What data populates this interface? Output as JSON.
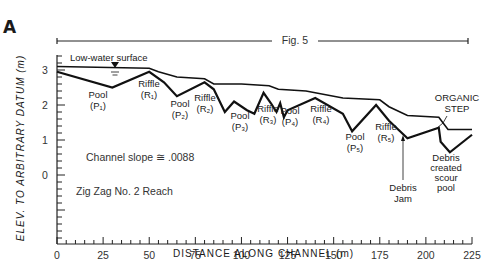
{
  "panel_label": "A",
  "figure_ref": "Fig. 5",
  "chart_data": {
    "type": "line",
    "title": "",
    "xlabel": "DISTANCE ALONG CHANNEL (m)",
    "ylabel": "ELEV. TO ARBITRARY DATUM (m)",
    "xlim": [
      0,
      225
    ],
    "ylim": [
      -1,
      3.5
    ],
    "x_ticks": [
      0,
      25,
      50,
      75,
      100,
      125,
      150,
      175,
      200,
      225
    ],
    "y_ticks": [
      0,
      1,
      2,
      3
    ],
    "grid": false,
    "series": [
      {
        "name": "Low-water surface",
        "x": [
          0,
          50,
          55,
          65,
          80,
          85,
          100,
          115,
          120,
          135,
          155,
          175,
          180,
          190,
          207,
          212,
          225
        ],
        "y": [
          3.1,
          3.05,
          2.95,
          2.8,
          2.75,
          2.6,
          2.6,
          2.55,
          2.45,
          2.4,
          2.2,
          2.15,
          1.95,
          1.7,
          1.65,
          1.3,
          1.3
        ]
      },
      {
        "name": "Channel bed",
        "x": [
          0,
          30,
          50,
          58,
          65,
          80,
          85,
          91,
          96,
          103,
          107,
          112,
          116,
          119,
          121,
          123,
          125,
          140,
          155,
          160,
          173,
          180,
          190,
          207,
          208,
          213,
          225
        ],
        "y": [
          2.95,
          2.5,
          2.95,
          2.65,
          2.25,
          2.65,
          2.45,
          1.8,
          2.1,
          1.85,
          1.75,
          2.35,
          2.05,
          1.8,
          2.05,
          1.65,
          1.85,
          2.2,
          1.75,
          1.25,
          2.0,
          1.55,
          1.05,
          1.35,
          0.95,
          0.65,
          1.15
        ]
      }
    ],
    "annotations": [
      {
        "text": "Low-water surface",
        "x": 10,
        "y": 3.25
      },
      {
        "text": "Pool (P1)",
        "x": 25,
        "y": 2.1
      },
      {
        "text": "Riffle (R1)",
        "x": 55,
        "y": 2.5
      },
      {
        "text": "Pool (P2)",
        "x": 70,
        "y": 1.9
      },
      {
        "text": "Riffle (R2)",
        "x": 85,
        "y": 2.0
      },
      {
        "text": "Pool (P3)",
        "x": 100,
        "y": 1.55
      },
      {
        "text": "Riffle (R3)",
        "x": 115,
        "y": 1.9
      },
      {
        "text": "Pool (P4)",
        "x": 127,
        "y": 1.85
      },
      {
        "text": "Riffle (R4)",
        "x": 145,
        "y": 1.9
      },
      {
        "text": "Pool (P5)",
        "x": 167,
        "y": 1.1
      },
      {
        "text": "Riffle (R5)",
        "x": 182,
        "y": 1.4
      },
      {
        "text": "Debris Jam",
        "x": 190,
        "y": 0.3
      },
      {
        "text": "Debris created scour pool",
        "x": 213,
        "y": 0.3
      },
      {
        "text": "ORGANIC STEP",
        "x": 215,
        "y": 2.05
      },
      {
        "text": "Channel slope ≅ .0088",
        "x": 10,
        "y": 0.8
      },
      {
        "text": "Zig Zag No. 2 Reach",
        "x": 10,
        "y": -0.25
      }
    ]
  },
  "labels": {
    "low_water": "Low-water surface",
    "slope": "Channel slope ≅ .0088",
    "reach": "Zig Zag No. 2 Reach",
    "organic1": "ORGANIC",
    "organic2": "STEP",
    "debris_jam1": "Debris",
    "debris_jam2": "Jam",
    "scour1": "Debris",
    "scour2": "created",
    "scour3": "scour",
    "scour4": "pool"
  }
}
